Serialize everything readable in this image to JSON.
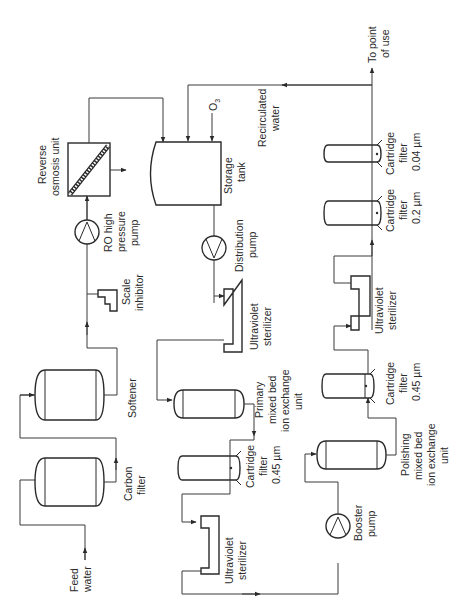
{
  "diagram": {
    "orientation": "rotated -90deg (text reads bottom to top)",
    "labels": {
      "feed_water": [
        "Feed",
        "water"
      ],
      "carbon_filter": [
        "Carbon",
        "filter"
      ],
      "softener": [
        "Softener"
      ],
      "scale_inhibitor": [
        "Scale",
        "inhibitor"
      ],
      "ro_pump": [
        "RO high",
        "pressure",
        "pump"
      ],
      "ro_unit": [
        "Reverse",
        "osmosis unit"
      ],
      "storage_tank": [
        "Storage",
        "tank"
      ],
      "ozone": "O",
      "ozone_sub": "3",
      "recirculated": [
        "Recirculated",
        "water"
      ],
      "to_point_of_use": [
        "To point",
        "of use"
      ],
      "distribution_pump": [
        "Distribution",
        "pump"
      ],
      "uv_sterilizer_1": [
        "Ultraviolet",
        "sterilizer"
      ],
      "primary_ix": [
        "Primary",
        "mixed bed",
        "ion exchange",
        "unit"
      ],
      "cartridge_045_a": [
        "Cartridge",
        "filter",
        "0.45 µm"
      ],
      "uv_sterilizer_2": [
        "Ultraviolet",
        "sterilizer"
      ],
      "booster_pump": [
        "Booster",
        "pump"
      ],
      "polishing_ix": [
        "Polishing",
        "mixed bed",
        "ion exchange",
        "unit"
      ],
      "cartridge_045_b": [
        "Cartridge",
        "filter",
        "0.45 µm"
      ],
      "uv_sterilizer_3": [
        "Ultraviolet",
        "sterilizer"
      ],
      "cartridge_02": [
        "Cartridge",
        "filter",
        "0.2 µm"
      ],
      "cartridge_004": [
        "Cartridge",
        "filter",
        "0.04 µm"
      ]
    },
    "flow_sequence": [
      "Feed water",
      "Carbon filter",
      "Softener",
      "Scale inhibitor",
      "RO high pressure pump",
      "Reverse osmosis unit",
      "Storage tank",
      "Distribution pump",
      "Ultraviolet sterilizer",
      "Primary mixed bed ion exchange unit",
      "Cartridge filter 0.45 µm",
      "Ultraviolet sterilizer",
      "Booster pump",
      "Polishing mixed bed ion exchange unit",
      "Cartridge filter 0.45 µm",
      "Ultraviolet sterilizer",
      "Cartridge filter 0.2 µm",
      "Cartridge filter 0.04 µm",
      "To point of use"
    ]
  }
}
